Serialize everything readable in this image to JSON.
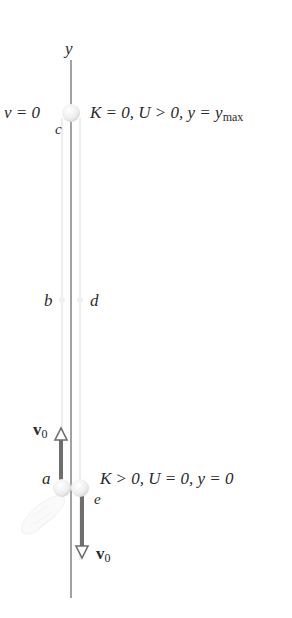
{
  "axis": {
    "label": "y"
  },
  "points": {
    "a": "a",
    "b": "b",
    "c": "c",
    "d": "d",
    "e": "e"
  },
  "top_state": {
    "velocity": "v = 0",
    "energy_K": "K = 0,",
    "energy_U": "U > 0,",
    "position_y": "y = y",
    "position_sub": "max"
  },
  "bottom_state": {
    "energy_K": "K > 0,",
    "energy_U": "U = 0,",
    "position_y": "y = 0"
  },
  "vectors": {
    "up": {
      "symbol": "v",
      "sub": "0"
    },
    "down": {
      "symbol": "v",
      "sub": "0"
    }
  },
  "colors": {
    "axis": "#777777",
    "arrow": "#6e6e6e",
    "ball": "#eeeeee",
    "trajectory": "#e8e8e8",
    "text": "#2a2a2a"
  }
}
